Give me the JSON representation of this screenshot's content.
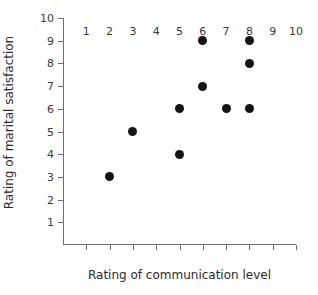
{
  "chart_data": {
    "type": "scatter",
    "title": "",
    "xlabel": "Rating of communication level",
    "ylabel": "Rating of marital satisfaction",
    "xlim": [
      0,
      10
    ],
    "ylim": [
      0,
      10
    ],
    "xticks": [
      1,
      2,
      3,
      4,
      5,
      6,
      7,
      8,
      9,
      10
    ],
    "yticks": [
      1,
      2,
      3,
      4,
      5,
      6,
      7,
      8,
      9,
      10
    ],
    "xtick_labels": [
      "1",
      "2",
      "3",
      "4",
      "5",
      "6",
      "7",
      "8",
      "9",
      "10"
    ],
    "ytick_labels": [
      "1",
      "2",
      "3",
      "4",
      "5",
      "6",
      "7",
      "8",
      "9",
      "10"
    ],
    "grid": false,
    "legend": null,
    "marker": "filled-circle",
    "marker_color": "#141414",
    "axis_color": "#6f6f6f",
    "background_color": "#ffffff",
    "points": [
      {
        "x": 2,
        "y": 3
      },
      {
        "x": 3,
        "y": 5
      },
      {
        "x": 5,
        "y": 4
      },
      {
        "x": 5,
        "y": 6
      },
      {
        "x": 6,
        "y": 7
      },
      {
        "x": 6,
        "y": 9
      },
      {
        "x": 7,
        "y": 6
      },
      {
        "x": 8,
        "y": 6
      },
      {
        "x": 8,
        "y": 8
      },
      {
        "x": 8,
        "y": 9
      }
    ]
  }
}
